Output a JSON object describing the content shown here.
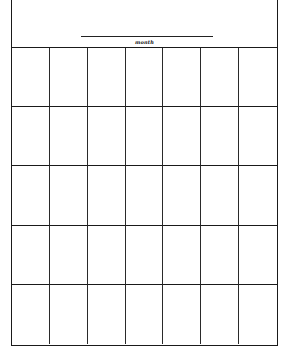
{
  "calendar": {
    "header": {
      "month_label": "month",
      "month_value": ""
    },
    "grid": {
      "columns": 7,
      "rows": 5,
      "cells": [
        [
          "",
          "",
          "",
          "",
          "",
          "",
          ""
        ],
        [
          "",
          "",
          "",
          "",
          "",
          "",
          ""
        ],
        [
          "",
          "",
          "",
          "",
          "",
          "",
          ""
        ],
        [
          "",
          "",
          "",
          "",
          "",
          "",
          ""
        ],
        [
          "",
          "",
          "",
          "",
          "",
          "",
          ""
        ]
      ]
    },
    "colors": {
      "line": "#1a1a1a",
      "background": "#ffffff"
    }
  }
}
